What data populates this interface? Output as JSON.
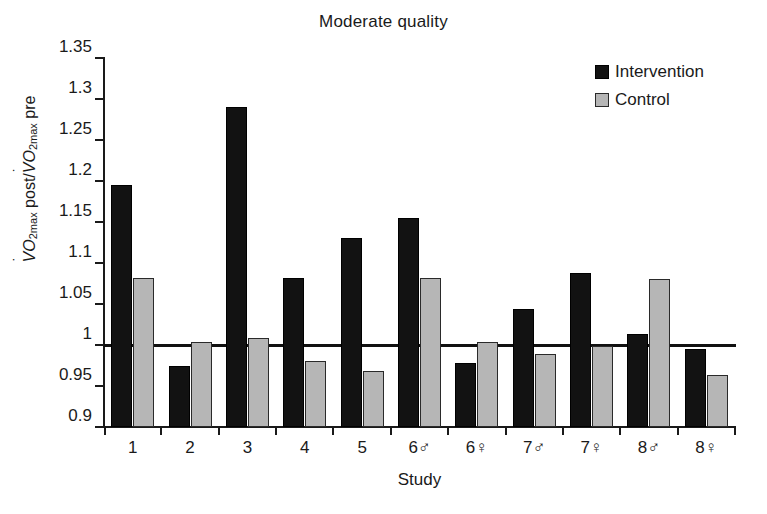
{
  "chart_data": {
    "type": "bar",
    "title": "Moderate quality",
    "xlabel": "Study",
    "ylabel": "VO2max post/VO2max pre",
    "ylabel_parts": {
      "v1": "V",
      "sub1": "O",
      "sub1b": "2max",
      "mid": " post/",
      "v2": "V",
      "sub2": "O",
      "sub2b": "2max",
      "end": " pre"
    },
    "ylim": [
      0.9,
      1.35
    ],
    "yticks": [
      1.35,
      1.3,
      1.25,
      1.2,
      1.15,
      1.1,
      1.05,
      1,
      0.95,
      0.9
    ],
    "ytick_labels": [
      "1.35",
      "1.3",
      "1.25",
      "1.2",
      "1.15",
      "1.1",
      "1.05",
      "1",
      "0.95",
      "0.9"
    ],
    "reference_line": 1.0,
    "grid": false,
    "legend_position": "top-right",
    "categories": [
      "1",
      "2",
      "3",
      "4",
      "5",
      "6♂",
      "6♀",
      "7♂",
      "7♀",
      "8♂",
      "8♀"
    ],
    "series": [
      {
        "name": "Intervention",
        "color": "#121212",
        "values": [
          1.195,
          0.975,
          1.29,
          1.082,
          1.13,
          1.155,
          0.978,
          1.044,
          1.088,
          1.014,
          0.995
        ]
      },
      {
        "name": "Control",
        "color": "#b6b6b6",
        "values": [
          1.082,
          1.004,
          1.008,
          0.981,
          0.968,
          1.082,
          1.004,
          0.989,
          0.999,
          1.081,
          0.963
        ]
      }
    ]
  },
  "legend": {
    "items": [
      {
        "label": "Intervention",
        "color": "#121212"
      },
      {
        "label": "Control",
        "color": "#b6b6b6"
      }
    ]
  }
}
